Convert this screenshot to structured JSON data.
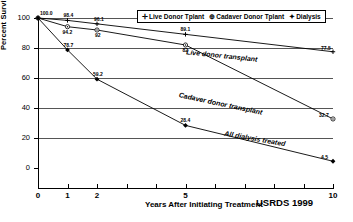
{
  "chart_data": {
    "type": "line",
    "title": "",
    "xlabel": "Years After Initiating Treatment",
    "ylabel": "Percent Surviving",
    "source": "USRDS 1999",
    "xlim": [
      0,
      10
    ],
    "ylim": [
      0,
      100
    ],
    "xticks": [
      "0",
      "1",
      "2",
      "5",
      "10"
    ],
    "xtick_values": [
      0,
      1,
      2,
      5,
      10
    ],
    "yticks": [
      "0",
      "20",
      "40",
      "60",
      "80",
      "100"
    ],
    "ytick_values": [
      0,
      20,
      40,
      60,
      80,
      100
    ],
    "grid": "horizontal",
    "legend_position": "top-right",
    "series": [
      {
        "name": "Live Donor Tplant",
        "marker": "cross",
        "annotation": "Live donor transplant",
        "x": [
          0,
          1,
          2,
          5,
          10
        ],
        "values": [
          100,
          98.4,
          96.1,
          89.1,
          77.5
        ],
        "point_labels": [
          "100.0",
          "98.4",
          "96.1",
          "89.1",
          "77.5"
        ]
      },
      {
        "name": "Cadaver Donor Tplant",
        "marker": "circle-dot",
        "annotation": "Cadaver donor transplant",
        "x": [
          0,
          1,
          2,
          5,
          10
        ],
        "values": [
          100,
          94.2,
          92.0,
          82.0,
          32.7
        ],
        "point_labels": [
          "100.0",
          "94.2",
          "92",
          "82",
          "32.7"
        ]
      },
      {
        "name": "Dialysis",
        "marker": "diamond",
        "annotation": "All dialysis treated",
        "x": [
          0,
          1,
          2,
          5,
          10
        ],
        "values": [
          100,
          78.7,
          59.2,
          28.4,
          4.5
        ],
        "point_labels": [
          "100.0",
          "78.7",
          "59.2",
          "28.4",
          "4.5"
        ]
      }
    ]
  },
  "legend": {
    "items": [
      {
        "marker": "cross-icon",
        "label": "Live Donor Tplant"
      },
      {
        "marker": "circle-dot-icon",
        "label": "Cadaver Donor Tplant"
      },
      {
        "marker": "diamond-icon",
        "label": "Dialysis"
      }
    ]
  }
}
